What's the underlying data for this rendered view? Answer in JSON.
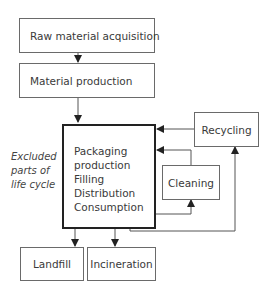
{
  "diagram": {
    "nodes": {
      "raw_material": "Raw material acquisition",
      "material_production": "Material production",
      "main_stage": [
        "Packaging",
        "production",
        "Filling",
        "Distribution",
        "Consumption"
      ],
      "recycling": "Recycling",
      "cleaning": "Cleaning",
      "landfill": "Landfill",
      "incineration": "Incineration"
    },
    "annotation": [
      "Excluded",
      "parts of",
      "life cycle"
    ],
    "edges": [
      {
        "from": "Raw material acquisition",
        "to": "Material production"
      },
      {
        "from": "Material production",
        "to": "Packaging production / Filling / Distribution / Consumption"
      },
      {
        "from": "Consumption",
        "to": "Landfill"
      },
      {
        "from": "Consumption",
        "to": "Incineration"
      },
      {
        "from": "Consumption",
        "to": "Cleaning"
      },
      {
        "from": "Cleaning",
        "to": "Packaging production"
      },
      {
        "from": "Consumption",
        "to": "Recycling"
      },
      {
        "from": "Recycling",
        "to": "Packaging production"
      }
    ]
  }
}
